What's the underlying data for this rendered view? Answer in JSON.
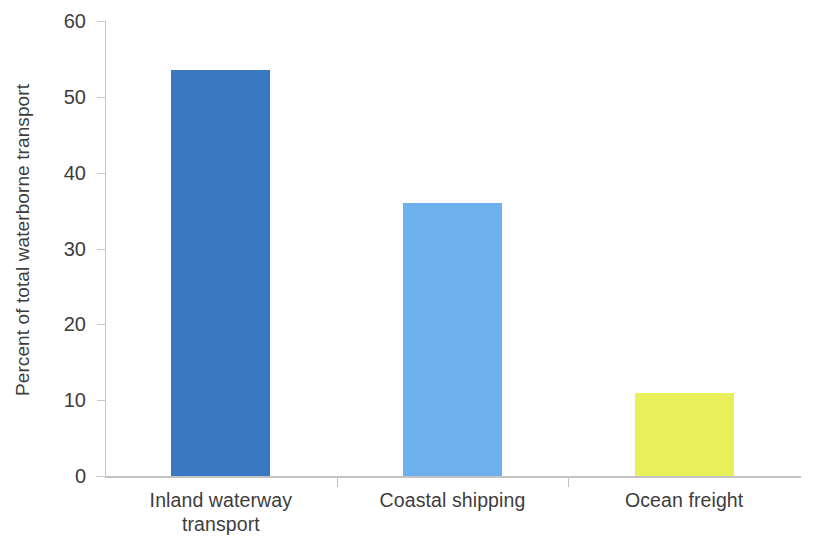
{
  "chart_data": {
    "type": "bar",
    "title": "",
    "xlabel": "",
    "ylabel": "Percent of total waterborne transport",
    "categories": [
      "Inland waterway transport",
      "Coastal shipping",
      "Ocean freight"
    ],
    "values": [
      53.5,
      36.0,
      11.0
    ],
    "colors": [
      "#3b78c3",
      "#6cb0ee",
      "#e8f05a"
    ],
    "ylim": [
      0,
      60
    ],
    "yticks": [
      0,
      10,
      20,
      30,
      40,
      50,
      60
    ],
    "ytick_labels": [
      "0",
      "10",
      "20",
      "30",
      "40",
      "50",
      "60"
    ],
    "grid": false,
    "legend": false,
    "series": [
      {
        "name": "Percent of total waterborne transport",
        "values": [
          53.5,
          36.0,
          11.0
        ]
      }
    ]
  },
  "axis": {
    "y_title": "Percent of total waterborne transport"
  },
  "categories": [
    {
      "line1": "Inland waterway",
      "line2": "transport"
    },
    {
      "line1": "Coastal shipping",
      "line2": ""
    },
    {
      "line1": "Ocean freight",
      "line2": ""
    }
  ]
}
